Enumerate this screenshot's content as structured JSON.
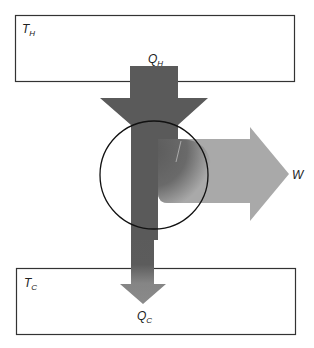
{
  "diagram": {
    "hot_reservoir": {
      "label": "T",
      "subscript": "H"
    },
    "cold_reservoir": {
      "label": "T",
      "subscript": "C"
    },
    "heat_in": {
      "label": "Q",
      "subscript": "H"
    },
    "heat_out": {
      "label": "Q",
      "subscript": "C"
    },
    "work": {
      "label": "W"
    },
    "engine": {
      "shape": "circle"
    },
    "colors": {
      "heat_in_arrow": "#5a5a5a",
      "work_arrow": "#a9a9a9",
      "heat_out_arrow": "#8a8a8a",
      "box_stroke": "#333333",
      "circle_stroke": "#111111"
    }
  }
}
